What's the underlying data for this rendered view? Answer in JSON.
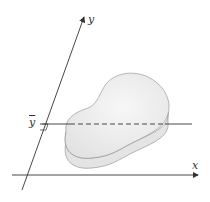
{
  "diagram": {
    "labels": {
      "y_axis": "y",
      "x_axis": "x",
      "y_bar": "y"
    },
    "colors": {
      "axis": "#333333",
      "blob_fill": "#ececec",
      "blob_edge": "#dcdcdc",
      "blob_stroke": "#8a8a8a"
    }
  }
}
